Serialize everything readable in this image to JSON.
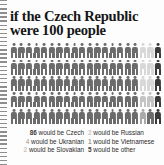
{
  "headline": "if the Czech Republic\nwere 100 people",
  "colors": {
    "figure_majority": "#6b6b6b",
    "figure_dark": "#3a3a3a",
    "figure_light": "#d8d8d8",
    "figure_mid": "#a9a9a9",
    "text": "#2b2b2b",
    "title": "#161616",
    "background": "#fdfdfd",
    "binding": "#7a7a7a"
  },
  "grid": {
    "total": 100,
    "columns": 20,
    "rows": 5,
    "legend_note": "each figure represents 1 person out of 100"
  },
  "stats": {
    "left": [
      {
        "num": "86",
        "text": "would be Czech",
        "color": "#3a3a3a",
        "emphasis": "strong"
      },
      {
        "num": "4",
        "text": "would be Ukranian",
        "color": "#b5b5b5",
        "emphasis": "light"
      },
      {
        "num": "2",
        "text": "would be Slovakian",
        "color": "#c6c6c6",
        "emphasis": "light"
      }
    ],
    "right": [
      {
        "num": "2",
        "text": "would be Russian",
        "color": "#c6c6c6",
        "emphasis": "light"
      },
      {
        "num": "1",
        "text": "would be Vietnamese",
        "color": "#9a9a9a",
        "emphasis": "light"
      },
      {
        "num": "5",
        "text": "would be other",
        "color": "#3a3a3a",
        "emphasis": "strong"
      }
    ]
  },
  "chart_data": {
    "type": "pictogram",
    "title": "if the Czech Republic were 100 people",
    "unit": "1 figure = 1 person",
    "total": 100,
    "categories": [
      "Czech",
      "Ukranian",
      "Slovakian",
      "Russian",
      "Vietnamese",
      "other"
    ],
    "values": [
      86,
      4,
      2,
      2,
      1,
      5
    ],
    "colors": [
      "#6b6b6b",
      "#d8d8d8",
      "#d8d8d8",
      "#c4c4c4",
      "#a9a9a9",
      "#3a3a3a"
    ],
    "xlabel": "",
    "ylabel": "",
    "grid": false,
    "legend": "inline-below"
  }
}
